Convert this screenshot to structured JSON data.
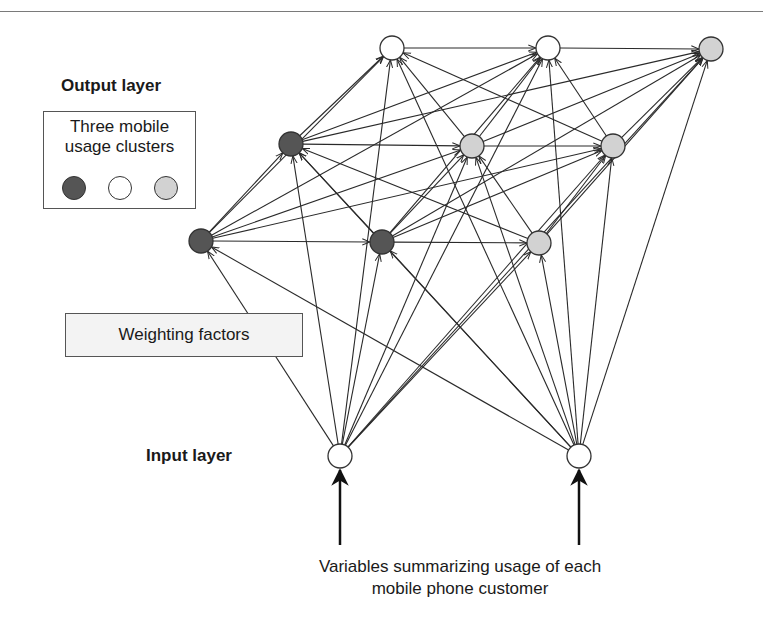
{
  "labels": {
    "output_layer": "Output layer",
    "input_layer": "Input layer",
    "weighting_factors": "Weighting factors",
    "legend_title_line1": "Three mobile",
    "legend_title_line2": "usage clusters",
    "caption_line1": "Variables summarizing usage of each",
    "caption_line2": "mobile phone customer"
  },
  "colors": {
    "cluster_dark": "#555555",
    "cluster_white": "#ffffff",
    "cluster_grey": "#d2d2d2",
    "edge": "#2a2a2a",
    "weight_box_bg": "#f3f3f3"
  },
  "legend": {
    "clusters": [
      {
        "name": "cluster-1",
        "color": "#555555"
      },
      {
        "name": "cluster-2",
        "color": "#ffffff"
      },
      {
        "name": "cluster-3",
        "color": "#d2d2d2"
      }
    ]
  },
  "network": {
    "output_nodes": [
      {
        "id": "o1",
        "x": 392,
        "y": 48,
        "cluster": "white"
      },
      {
        "id": "o2",
        "x": 548,
        "y": 48,
        "cluster": "white"
      },
      {
        "id": "o3",
        "x": 711,
        "y": 49,
        "cluster": "grey"
      },
      {
        "id": "o4",
        "x": 291,
        "y": 144,
        "cluster": "dark"
      },
      {
        "id": "o5",
        "x": 472,
        "y": 146,
        "cluster": "grey"
      },
      {
        "id": "o6",
        "x": 613,
        "y": 146,
        "cluster": "grey"
      },
      {
        "id": "o7",
        "x": 201,
        "y": 241,
        "cluster": "dark"
      },
      {
        "id": "o8",
        "x": 382,
        "y": 242,
        "cluster": "dark"
      },
      {
        "id": "o9",
        "x": 539,
        "y": 243,
        "cluster": "grey"
      }
    ],
    "input_nodes": [
      {
        "id": "i1",
        "x": 340,
        "y": 456
      },
      {
        "id": "i2",
        "x": 579,
        "y": 456
      }
    ],
    "grid_links": [
      [
        "o1",
        "o2"
      ],
      [
        "o2",
        "o3"
      ],
      [
        "o4",
        "o5"
      ],
      [
        "o5",
        "o6"
      ],
      [
        "o7",
        "o8"
      ],
      [
        "o8",
        "o9"
      ],
      [
        "o4",
        "o1"
      ],
      [
        "o4",
        "o2"
      ],
      [
        "o4",
        "o3"
      ],
      [
        "o5",
        "o1"
      ],
      [
        "o5",
        "o2"
      ],
      [
        "o5",
        "o3"
      ],
      [
        "o6",
        "o1"
      ],
      [
        "o6",
        "o2"
      ],
      [
        "o6",
        "o3"
      ],
      [
        "o7",
        "o4"
      ],
      [
        "o7",
        "o5"
      ],
      [
        "o7",
        "o6"
      ],
      [
        "o8",
        "o4"
      ],
      [
        "o8",
        "o5"
      ],
      [
        "o8",
        "o6"
      ],
      [
        "o9",
        "o4"
      ],
      [
        "o9",
        "o5"
      ],
      [
        "o9",
        "o6"
      ],
      [
        "o7",
        "o1"
      ],
      [
        "o7",
        "o2"
      ],
      [
        "o8",
        "o2"
      ],
      [
        "o8",
        "o3"
      ],
      [
        "o9",
        "o3"
      ]
    ]
  }
}
